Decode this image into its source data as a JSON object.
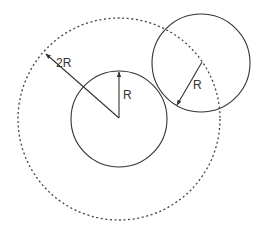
{
  "diagram": {
    "stroke_color": "#333333",
    "outer_circle": {
      "cx": 119,
      "cy": 119,
      "r": 101,
      "style": "dotted"
    },
    "inner_circle": {
      "cx": 119,
      "cy": 119,
      "r": 48,
      "style": "solid"
    },
    "moving_circle": {
      "cx": 201,
      "cy": 63,
      "r": 49,
      "style": "solid"
    },
    "labels": {
      "outer_radius": "2R",
      "inner_radius": "R",
      "moving_radius": "R"
    }
  }
}
